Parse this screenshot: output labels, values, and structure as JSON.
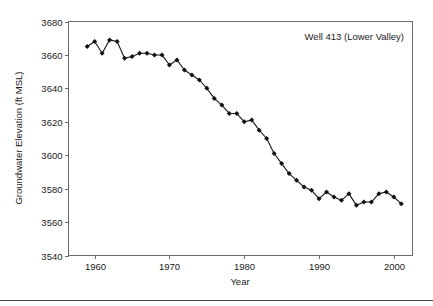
{
  "figure": {
    "annotation": "Well 413 (Lower Valley)",
    "background_color": "#ffffff",
    "frame_color": "#6b6b6b",
    "series_color": "#1a1a1a"
  },
  "axes": {
    "x_title": "Year",
    "y_title": "Groundwater Elevation (ft MSL)",
    "x_ticks": [
      "1960",
      "1970",
      "1980",
      "1990",
      "2000"
    ],
    "y_ticks": [
      "3680",
      "3660",
      "3640",
      "3620",
      "3600",
      "3580",
      "3560",
      "3540"
    ]
  },
  "chart_data": {
    "type": "line",
    "title": "",
    "subtitle": "",
    "annotations": [
      "Well 413 (Lower Valley)"
    ],
    "xlabel": "Year",
    "ylabel": "Groundwater Elevation (ft MSL)",
    "xlim": [
      1956.5,
      2002.5
    ],
    "ylim": [
      3540,
      3680
    ],
    "xticks": [
      1960,
      1970,
      1980,
      1990,
      2000
    ],
    "yticks": [
      3540,
      3560,
      3580,
      3600,
      3620,
      3640,
      3660,
      3680
    ],
    "grid": false,
    "legend": false,
    "legend_position": "none",
    "marker": "diamond",
    "series": [
      {
        "name": "Well 413 (Lower Valley)",
        "x": [
          1959,
          1960,
          1961,
          1962,
          1963,
          1964,
          1965,
          1966,
          1967,
          1968,
          1969,
          1970,
          1971,
          1972,
          1973,
          1974,
          1975,
          1976,
          1977,
          1978,
          1979,
          1980,
          1981,
          1982,
          1983,
          1984,
          1985,
          1986,
          1987,
          1988,
          1989,
          1990,
          1991,
          1992,
          1993,
          1994,
          1995,
          1996,
          1997,
          1998,
          1999,
          2000,
          2001
        ],
        "values": [
          3665,
          3668,
          3661,
          3669,
          3668,
          3658,
          3659,
          3661,
          3661,
          3660,
          3660,
          3654,
          3657,
          3651,
          3648,
          3645,
          3640,
          3634,
          3630,
          3625,
          3625,
          3620,
          3621,
          3615,
          3610,
          3601,
          3595,
          3589,
          3585,
          3581,
          3579,
          3574,
          3578,
          3575,
          3573,
          3577,
          3570,
          3572,
          3572,
          3577,
          3578,
          3575,
          3571
        ]
      }
    ]
  }
}
